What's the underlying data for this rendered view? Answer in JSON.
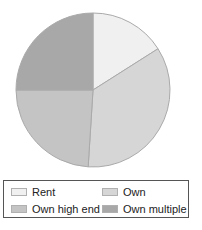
{
  "chart_data": {
    "type": "pie",
    "title": "",
    "categories": [
      "Rent",
      "Own",
      "Own high end",
      "Own multiple"
    ],
    "values": [
      16,
      35,
      24,
      25
    ],
    "unit": "percent (estimated from slice angles)",
    "start_angle": "12 o'clock",
    "direction": "clockwise",
    "colors": [
      "#f0f0f0",
      "#d6d6d6",
      "#c4c4c4",
      "#a8a8a8"
    ],
    "legend_position": "bottom",
    "data_labels": false
  },
  "legend": {
    "items": [
      {
        "label": "Rent",
        "color": "#f0f0f0"
      },
      {
        "label": "Own",
        "color": "#d6d6d6"
      },
      {
        "label": "Own high end",
        "color": "#c4c4c4"
      },
      {
        "label": "Own multiple",
        "color": "#a8a8a8"
      }
    ]
  },
  "style": {
    "slice_stroke": "#aaaaaa"
  }
}
